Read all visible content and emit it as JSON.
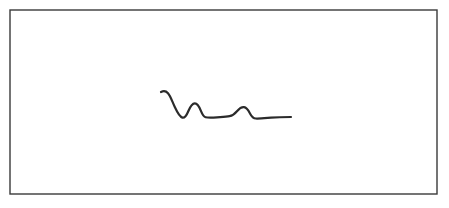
{
  "figure": {
    "title": "",
    "caption": "",
    "background_color": "#ffffff",
    "frame": {
      "name": "border-rectangle",
      "x": 10,
      "y": 10,
      "width": 427,
      "height": 184,
      "stroke_color": "#3a3a3a",
      "stroke_width": 1.4,
      "fill_color": "#ffffff"
    },
    "curve": {
      "name": "waveform-curve",
      "stroke_color": "#2b2b2b",
      "stroke_width": 2.2,
      "style": "hand-drawn-smooth",
      "start_point": [
        161,
        92
      ],
      "end_point": [
        291,
        117
      ],
      "features": [
        {
          "label": "start-plateau",
          "x": 161,
          "y": 92,
          "kind": "endpoint-hook"
        },
        {
          "label": "descent-inflection",
          "x": 173,
          "y": 100,
          "kind": "inflection"
        },
        {
          "label": "main-trough",
          "x": 184,
          "y": 116,
          "kind": "minimum"
        },
        {
          "label": "first-bump-peak",
          "x": 196,
          "y": 104,
          "kind": "maximum"
        },
        {
          "label": "baseline-entry",
          "x": 206,
          "y": 117,
          "kind": "shoulder"
        },
        {
          "label": "baseline-flat-1",
          "x": 228,
          "y": 117,
          "kind": "plateau"
        },
        {
          "label": "second-bump-peak",
          "x": 245,
          "y": 108,
          "kind": "maximum"
        },
        {
          "label": "baseline-reentry",
          "x": 258,
          "y": 118,
          "kind": "shoulder"
        },
        {
          "label": "baseline-flat-2",
          "x": 291,
          "y": 117,
          "kind": "plateau-end"
        }
      ],
      "path_d": "M 161 92 C 163.5 90.8 166 91 168 93.2 C 170.6 96.2 172.2 101.5 174.8 107 C 177.4 112.6 179.8 116.8 182.4 117.6 C 184.8 118.3 186.6 115.4 188.4 111 C 190.4 106.2 192.6 103.4 194.8 103.3 C 197 103.2 199 106 200.8 110.6 C 202.4 114.6 203.8 116.8 205.6 117.2 C 208.4 117.8 212.5 117.6 217 117.3 C 221.5 117 226 116.9 229.6 116.2 C 232.8 115.6 235 113.6 237.2 111 C 239.6 108.2 241.8 106.9 244 107.2 C 246.2 107.5 248.2 110 250 113.4 C 251.8 116.8 253.6 118.4 255.8 118.5 C 259.5 118.7 265 118.1 271 117.6 C 277.5 117.1 284.5 117 291 117"
    }
  }
}
